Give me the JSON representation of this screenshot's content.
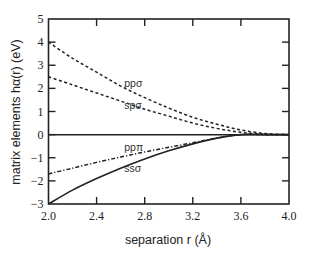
{
  "chart_data": {
    "type": "line",
    "title": "",
    "xlabel": "separation r (Å)",
    "ylabel": "matrix elements hα(r) (eV)",
    "xlim": [
      2.0,
      4.0
    ],
    "ylim": [
      -3,
      5
    ],
    "grid": false,
    "legend": "inline labels",
    "x_ticks": [
      "2.0",
      "2.4",
      "2.8",
      "3.2",
      "3.6",
      "4.0"
    ],
    "y_ticks": [
      "-3",
      "-2",
      "-1",
      "0",
      "1",
      "2",
      "3",
      "4",
      "5"
    ],
    "x": [
      2.0,
      2.2,
      2.4,
      2.6,
      2.8,
      3.0,
      3.2,
      3.4,
      3.6,
      3.8,
      4.0
    ],
    "series": [
      {
        "name": "ppσ",
        "style": "dashed",
        "values": [
          4.0,
          3.3,
          2.7,
          2.1,
          1.6,
          1.15,
          0.75,
          0.45,
          0.2,
          0.05,
          0.0
        ]
      },
      {
        "name": "spσ",
        "style": "dashed",
        "values": [
          2.5,
          2.15,
          1.8,
          1.45,
          1.1,
          0.8,
          0.5,
          0.27,
          0.1,
          0.02,
          0.0
        ]
      },
      {
        "name": "ppπ",
        "style": "dash-dot",
        "values": [
          -1.7,
          -1.45,
          -1.2,
          -0.97,
          -0.75,
          -0.55,
          -0.35,
          -0.15,
          0.0,
          0.0,
          0.0
        ]
      },
      {
        "name": "ssσ",
        "style": "solid",
        "values": [
          -3.0,
          -2.4,
          -1.9,
          -1.45,
          -1.05,
          -0.7,
          -0.4,
          -0.15,
          0.0,
          0.0,
          0.0
        ]
      }
    ],
    "zero_line": true,
    "annotations": [
      {
        "text": "ppσ",
        "x": 2.63,
        "y": 2.05
      },
      {
        "text": "spσ",
        "x": 2.63,
        "y": 1.1
      },
      {
        "text": "ppπ",
        "x": 2.63,
        "y": -0.7
      },
      {
        "text": "ssσ",
        "x": 2.63,
        "y": -1.6
      }
    ]
  }
}
